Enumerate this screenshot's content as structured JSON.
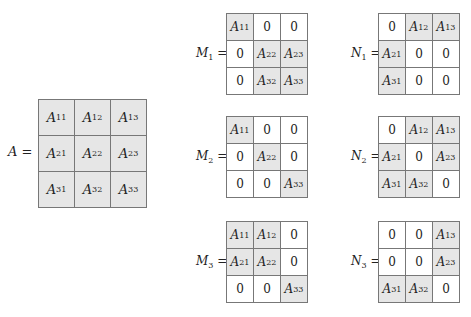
{
  "matrices": {
    "A": {
      "label": "A =",
      "name": "A",
      "cells": [
        [
          {
            "v": "A",
            "s": "11",
            "h": true
          },
          {
            "v": "A",
            "s": "12",
            "h": true
          },
          {
            "v": "A",
            "s": "13",
            "h": true
          }
        ],
        [
          {
            "v": "A",
            "s": "21",
            "h": true
          },
          {
            "v": "A",
            "s": "22",
            "h": true
          },
          {
            "v": "A",
            "s": "23",
            "h": true
          }
        ],
        [
          {
            "v": "A",
            "s": "31",
            "h": true
          },
          {
            "v": "A",
            "s": "32",
            "h": true
          },
          {
            "v": "A",
            "s": "33",
            "h": true
          }
        ]
      ]
    },
    "M1": {
      "label": "M",
      "sub": "1",
      "cells": [
        [
          {
            "v": "A",
            "s": "11",
            "h": true
          },
          {
            "v": "0"
          },
          {
            "v": "0"
          }
        ],
        [
          {
            "v": "0"
          },
          {
            "v": "A",
            "s": "22",
            "h": true
          },
          {
            "v": "A",
            "s": "23",
            "h": true
          }
        ],
        [
          {
            "v": "0"
          },
          {
            "v": "A",
            "s": "32",
            "h": true
          },
          {
            "v": "A",
            "s": "33",
            "h": true
          }
        ]
      ]
    },
    "M2": {
      "label": "M",
      "sub": "2",
      "cells": [
        [
          {
            "v": "A",
            "s": "11",
            "h": true
          },
          {
            "v": "0"
          },
          {
            "v": "0"
          }
        ],
        [
          {
            "v": "0"
          },
          {
            "v": "A",
            "s": "22",
            "h": true
          },
          {
            "v": "0"
          }
        ],
        [
          {
            "v": "0"
          },
          {
            "v": "0"
          },
          {
            "v": "A",
            "s": "33",
            "h": true
          }
        ]
      ]
    },
    "M3": {
      "label": "M",
      "sub": "3",
      "cells": [
        [
          {
            "v": "A",
            "s": "11",
            "h": true
          },
          {
            "v": "A",
            "s": "12",
            "h": true
          },
          {
            "v": "0"
          }
        ],
        [
          {
            "v": "A",
            "s": "21",
            "h": true
          },
          {
            "v": "A",
            "s": "22",
            "h": true
          },
          {
            "v": "0"
          }
        ],
        [
          {
            "v": "0"
          },
          {
            "v": "0"
          },
          {
            "v": "A",
            "s": "33",
            "h": true
          }
        ]
      ]
    },
    "N1": {
      "label": "N",
      "sub": "1",
      "cells": [
        [
          {
            "v": "0"
          },
          {
            "v": "A",
            "s": "12",
            "h": true
          },
          {
            "v": "A",
            "s": "13",
            "h": true
          }
        ],
        [
          {
            "v": "A",
            "s": "21",
            "h": true
          },
          {
            "v": "0"
          },
          {
            "v": "0"
          }
        ],
        [
          {
            "v": "A",
            "s": "31",
            "h": true
          },
          {
            "v": "0"
          },
          {
            "v": "0"
          }
        ]
      ]
    },
    "N2": {
      "label": "N",
      "sub": "2",
      "cells": [
        [
          {
            "v": "0"
          },
          {
            "v": "A",
            "s": "12",
            "h": true
          },
          {
            "v": "A",
            "s": "13",
            "h": true
          }
        ],
        [
          {
            "v": "A",
            "s": "21",
            "h": true
          },
          {
            "v": "0"
          },
          {
            "v": "A",
            "s": "23",
            "h": true
          }
        ],
        [
          {
            "v": "A",
            "s": "31",
            "h": true
          },
          {
            "v": "A",
            "s": "32",
            "h": true
          },
          {
            "v": "0"
          }
        ]
      ]
    },
    "N3": {
      "label": "N",
      "sub": "3",
      "cells": [
        [
          {
            "v": "0"
          },
          {
            "v": "0"
          },
          {
            "v": "A",
            "s": "13",
            "h": true
          }
        ],
        [
          {
            "v": "0"
          },
          {
            "v": "0"
          },
          {
            "v": "A",
            "s": "23",
            "h": true
          }
        ],
        [
          {
            "v": "A",
            "s": "31",
            "h": true
          },
          {
            "v": "A",
            "s": "32",
            "h": true
          },
          {
            "v": "0"
          }
        ]
      ]
    }
  },
  "colors": {
    "highlight": "#e6e6e6",
    "plain": "#ffffff",
    "border": "#777777"
  }
}
